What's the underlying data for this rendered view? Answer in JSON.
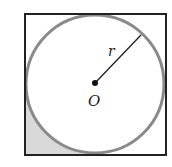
{
  "figure": {
    "labels": {
      "radius": "r",
      "center": "O"
    },
    "shapes": {
      "square": {
        "x": 25,
        "y": 14,
        "size": 141,
        "stroke": "#222222"
      },
      "circle": {
        "cx": 95,
        "cy": 84,
        "r": 69,
        "stroke": "#8a8a8a"
      },
      "shaded_region": {
        "corner": "bottom-left",
        "fill": "#d9d9d9"
      },
      "radius_line": {
        "x1": 95,
        "y1": 83,
        "x2": 141,
        "y2": 35
      }
    }
  }
}
